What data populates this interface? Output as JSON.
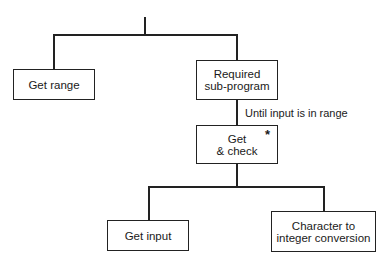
{
  "diagram": {
    "type": "structure-chart",
    "nodes": [
      {
        "id": "get-range",
        "label": "Get range"
      },
      {
        "id": "required-sub-program",
        "label": "Required\nsub-program",
        "line1": "Required",
        "line2": "sub-program"
      },
      {
        "id": "get-and-check",
        "label": "Get\n& check",
        "line1": "Get",
        "line2": "& check",
        "marker": "*"
      },
      {
        "id": "get-input",
        "label": "Get input"
      },
      {
        "id": "char-to-int",
        "label": "Character to\ninteger conversion",
        "line1": "Character to",
        "line2": "integer conversion"
      }
    ],
    "edges": [
      {
        "from": "root",
        "to": "get-range"
      },
      {
        "from": "root",
        "to": "required-sub-program"
      },
      {
        "from": "required-sub-program",
        "to": "get-and-check",
        "annotation": "Until input is in range"
      },
      {
        "from": "get-and-check",
        "to": "get-input"
      },
      {
        "from": "get-and-check",
        "to": "char-to-int"
      }
    ],
    "annotation": "Until input is in range",
    "iteration_marker": "*"
  }
}
